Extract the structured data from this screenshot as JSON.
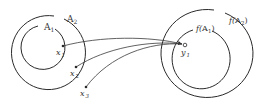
{
  "diagram": {
    "stroke_color": "#2a2a2a",
    "domain": {
      "outer_set": {
        "label": "A",
        "sub": "2"
      },
      "inner_set": {
        "label": "A",
        "sub": "1"
      },
      "points": [
        {
          "label": "x",
          "sub": "1"
        },
        {
          "label": "x",
          "sub": "2"
        },
        {
          "label": "x",
          "sub": "3"
        }
      ]
    },
    "codomain": {
      "outer_set": {
        "prefix": "f(",
        "label": "A",
        "sub": "2",
        "suffix": ")"
      },
      "inner_set": {
        "prefix": "f(",
        "label": "A",
        "sub": "1",
        "suffix": ")"
      },
      "point": {
        "label": "y",
        "sub": "1"
      }
    }
  }
}
